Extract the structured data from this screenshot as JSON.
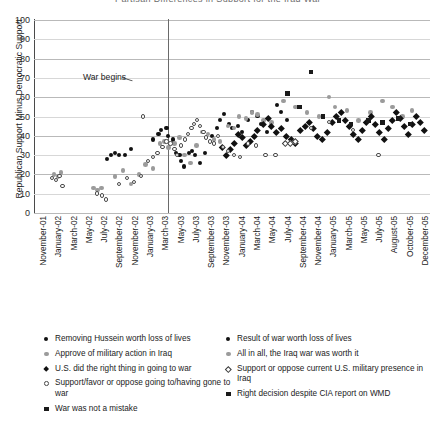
{
  "chart_data": {
    "type": "scatter",
    "title": "Partisan Differences in Support for the Iraq War",
    "xlabel": "",
    "ylabel": "Republican Support Minus Democratic Support",
    "ylim": [
      0,
      100
    ],
    "yticks": [
      0,
      10,
      20,
      30,
      40,
      50,
      60,
      70,
      80,
      90,
      100
    ],
    "grid": "horizontal",
    "legend_position": "bottom",
    "annotations": [
      {
        "text": "War begins",
        "x": "March-03",
        "note": "vertical reference line at start of Iraq war"
      }
    ],
    "xticks": [
      "November-01",
      "January-02",
      "March-02",
      "May-02",
      "July-02",
      "September-02",
      "November-02",
      "January-03",
      "March-03",
      "May-03",
      "July-03",
      "September-03",
      "November-03",
      "January-04",
      "March-04",
      "May-04",
      "July-04",
      "September-04",
      "November-04",
      "January-05",
      "March-05",
      "May-05",
      "July-05",
      "August-05",
      "October-05",
      "December-05"
    ],
    "series": [
      {
        "name": "Removing Hussein worth loss of lives",
        "marker": "circ-filled",
        "points": [
          [
            0.185,
            28
          ],
          [
            0.195,
            30
          ],
          [
            0.205,
            31
          ],
          [
            0.215,
            30
          ],
          [
            0.23,
            30
          ],
          [
            0.245,
            33
          ],
          [
            0.3,
            38
          ],
          [
            0.315,
            41
          ],
          [
            0.322,
            43
          ],
          [
            0.335,
            44
          ],
          [
            0.34,
            40
          ],
          [
            0.352,
            38
          ],
          [
            0.36,
            31
          ],
          [
            0.368,
            30
          ],
          [
            0.372,
            27
          ],
          [
            0.38,
            24
          ],
          [
            0.392,
            31
          ],
          [
            0.4,
            32
          ],
          [
            0.408,
            30
          ],
          [
            0.42,
            26
          ],
          [
            0.432,
            31
          ],
          [
            0.45,
            40
          ],
          [
            0.462,
            44
          ],
          [
            0.47,
            48
          ],
          [
            0.48,
            51
          ],
          [
            0.492,
            46
          ],
          [
            0.5,
            44
          ],
          [
            0.515,
            45
          ],
          [
            0.525,
            42
          ],
          [
            0.54,
            48
          ],
          [
            0.552,
            52
          ],
          [
            0.565,
            50
          ],
          [
            0.575,
            46
          ],
          [
            0.59,
            42
          ],
          [
            0.6,
            45
          ],
          [
            0.615,
            56
          ],
          [
            0.625,
            52
          ],
          [
            0.64,
            48
          ]
        ]
      },
      {
        "name": "Approve of military action in Iraq",
        "marker": "circ-gray",
        "points": [
          [
            0.05,
            20
          ],
          [
            0.06,
            19
          ],
          [
            0.068,
            21
          ],
          [
            0.15,
            13
          ],
          [
            0.16,
            12
          ],
          [
            0.17,
            13
          ],
          [
            0.205,
            19
          ],
          [
            0.225,
            22
          ],
          [
            0.245,
            15
          ],
          [
            0.265,
            20
          ],
          [
            0.282,
            25
          ],
          [
            0.3,
            23
          ],
          [
            0.318,
            36
          ],
          [
            0.33,
            37
          ],
          [
            0.34,
            34
          ],
          [
            0.355,
            36
          ],
          [
            0.368,
            39
          ],
          [
            0.38,
            30
          ],
          [
            0.395,
            26
          ],
          [
            0.41,
            35
          ],
          [
            0.425,
            42
          ],
          [
            0.44,
            41
          ],
          [
            0.455,
            38
          ],
          [
            0.47,
            37
          ],
          [
            0.49,
            45
          ],
          [
            0.505,
            44
          ],
          [
            0.518,
            50
          ],
          [
            0.535,
            49
          ],
          [
            0.55,
            52
          ],
          [
            0.565,
            51
          ],
          [
            0.58,
            48
          ],
          [
            0.6,
            47
          ],
          [
            0.63,
            58
          ],
          [
            0.66,
            55
          ],
          [
            0.69,
            52
          ],
          [
            0.72,
            50
          ],
          [
            0.745,
            60
          ],
          [
            0.76,
            55
          ],
          [
            0.79,
            53
          ],
          [
            0.82,
            48
          ],
          [
            0.85,
            52
          ],
          [
            0.88,
            58
          ],
          [
            0.905,
            55
          ],
          [
            0.93,
            50
          ],
          [
            0.955,
            53
          ]
        ]
      },
      {
        "name": "U.S. did the right thing in going to war",
        "marker": "diam-filled",
        "points": [
          [
            0.565,
            43
          ],
          [
            0.58,
            46
          ],
          [
            0.592,
            49
          ],
          [
            0.6,
            45
          ],
          [
            0.612,
            42
          ],
          [
            0.625,
            44
          ],
          [
            0.638,
            40
          ],
          [
            0.65,
            38
          ],
          [
            0.66,
            36
          ],
          [
            0.672,
            43
          ],
          [
            0.685,
            45
          ],
          [
            0.695,
            47
          ],
          [
            0.705,
            44
          ],
          [
            0.715,
            40
          ],
          [
            0.728,
            38
          ],
          [
            0.74,
            42
          ],
          [
            0.752,
            47
          ],
          [
            0.762,
            50
          ],
          [
            0.775,
            52
          ],
          [
            0.785,
            48
          ],
          [
            0.795,
            45
          ],
          [
            0.805,
            41
          ],
          [
            0.818,
            38
          ],
          [
            0.828,
            43
          ],
          [
            0.84,
            47
          ],
          [
            0.852,
            50
          ],
          [
            0.862,
            46
          ],
          [
            0.872,
            42
          ],
          [
            0.885,
            38
          ],
          [
            0.895,
            44
          ],
          [
            0.905,
            48
          ],
          [
            0.915,
            52
          ],
          [
            0.925,
            49
          ],
          [
            0.935,
            45
          ],
          [
            0.945,
            41
          ],
          [
            0.955,
            46
          ],
          [
            0.965,
            50
          ],
          [
            0.975,
            47
          ],
          [
            0.985,
            43
          ],
          [
            0.555,
            40
          ],
          [
            0.545,
            37
          ],
          [
            0.535,
            35
          ],
          [
            0.525,
            39
          ],
          [
            0.515,
            41
          ],
          [
            0.505,
            36
          ],
          [
            0.495,
            33
          ],
          [
            0.485,
            30
          ],
          [
            0.475,
            34
          ]
        ]
      },
      {
        "name": "Support/favor or oppose going to/having gone to war",
        "marker": "circ-open",
        "points": [
          [
            0.045,
            18
          ],
          [
            0.055,
            17
          ],
          [
            0.065,
            19
          ],
          [
            0.072,
            14
          ],
          [
            0.16,
            10
          ],
          [
            0.172,
            9
          ],
          [
            0.182,
            7
          ],
          [
            0.215,
            15
          ],
          [
            0.235,
            18
          ],
          [
            0.252,
            16
          ],
          [
            0.27,
            19
          ],
          [
            0.288,
            27
          ],
          [
            0.3,
            29
          ],
          [
            0.312,
            31
          ],
          [
            0.325,
            34
          ],
          [
            0.335,
            37
          ],
          [
            0.345,
            36
          ],
          [
            0.355,
            33
          ],
          [
            0.362,
            30
          ],
          [
            0.372,
            35
          ],
          [
            0.382,
            38
          ],
          [
            0.39,
            41
          ],
          [
            0.398,
            44
          ],
          [
            0.405,
            46
          ],
          [
            0.412,
            48
          ],
          [
            0.42,
            45
          ],
          [
            0.428,
            42
          ],
          [
            0.435,
            39
          ],
          [
            0.445,
            37
          ],
          [
            0.455,
            36
          ],
          [
            0.275,
            50
          ],
          [
            0.465,
            40
          ],
          [
            0.478,
            34
          ],
          [
            0.49,
            32
          ],
          [
            0.505,
            30
          ],
          [
            0.52,
            29
          ],
          [
            0.54,
            36
          ],
          [
            0.56,
            35
          ],
          [
            0.585,
            30
          ],
          [
            0.61,
            30
          ],
          [
            0.7,
            44
          ],
          [
            0.745,
            47
          ],
          [
            0.805,
            43
          ],
          [
            0.87,
            30
          ]
        ]
      },
      {
        "name": "War was not a mistake",
        "marker": "sq-filled",
        "points": [
          [
            0.7,
            73
          ],
          [
            0.64,
            62
          ],
          [
            0.67,
            55
          ],
          [
            0.73,
            50
          ],
          [
            0.77,
            48
          ],
          [
            0.8,
            46
          ],
          [
            0.845,
            48
          ],
          [
            0.88,
            47
          ],
          [
            0.92,
            49
          ],
          [
            0.95,
            46
          ]
        ]
      },
      {
        "name": "Result of war worth loss of lives",
        "marker": "circ-filled",
        "points": []
      },
      {
        "name": "All in all, the Iraq war was worth it",
        "marker": "circ-gray",
        "points": []
      },
      {
        "name": "Support or oppose current U.S. military presence in Iraq",
        "marker": "diam-open",
        "points": [
          [
            0.635,
            36
          ],
          [
            0.648,
            36
          ],
          [
            0.66,
            37
          ]
        ]
      },
      {
        "name": "Right decision despite CIA report on WMD",
        "marker": "sq-filled",
        "points": []
      }
    ]
  },
  "axes": {
    "y_title": "Republican Support Minus Democratic Support",
    "y_ticks": [
      "100",
      "90",
      "80",
      "70",
      "60",
      "50",
      "40",
      "30",
      "20",
      "10",
      "0"
    ],
    "x_ticks": [
      "November-01",
      "January-02",
      "March-02",
      "May-02",
      "July-02",
      "September-02",
      "November-02",
      "January-03",
      "March-03",
      "May-03",
      "July-03",
      "September-03",
      "November-03",
      "January-04",
      "March-04",
      "May-04",
      "July-04",
      "September-04",
      "November-04",
      "January-05",
      "March-05",
      "May-05",
      "July-05",
      "August-05",
      "October-05",
      "December-05"
    ]
  },
  "annotation": {
    "war_begins": "War begins"
  },
  "title": "Partisan Differences in Support for the Iraq War",
  "legend": {
    "left": [
      {
        "label": "Removing Hussein worth loss of lives",
        "marker": "circ-filled"
      },
      {
        "label": "Approve of military action in Iraq",
        "marker": "circ-gray"
      },
      {
        "label": "U.S. did the right thing in going to war",
        "marker": "diam-filled"
      },
      {
        "label": "Support/favor or oppose going to/having gone to war",
        "marker": "circ-open"
      },
      {
        "label": "War was not a mistake",
        "marker": "sq-filled"
      }
    ],
    "right": [
      {
        "label": "Result of war worth loss of lives",
        "marker": "circ-filled"
      },
      {
        "label": "All in all, the Iraq war was worth it",
        "marker": "circ-gray"
      },
      {
        "label": "Support or oppose current U.S. military presence in Iraq",
        "marker": "diam-open"
      },
      {
        "label": "Right decision despite CIA report on WMD",
        "marker": "sq-filled"
      }
    ]
  },
  "colors": {
    "axis": "#4a4a4a",
    "grid": "#b9b9b9",
    "marker_dark": "#111111",
    "marker_gray": "#9b9b9b",
    "background": "#ffffff"
  }
}
